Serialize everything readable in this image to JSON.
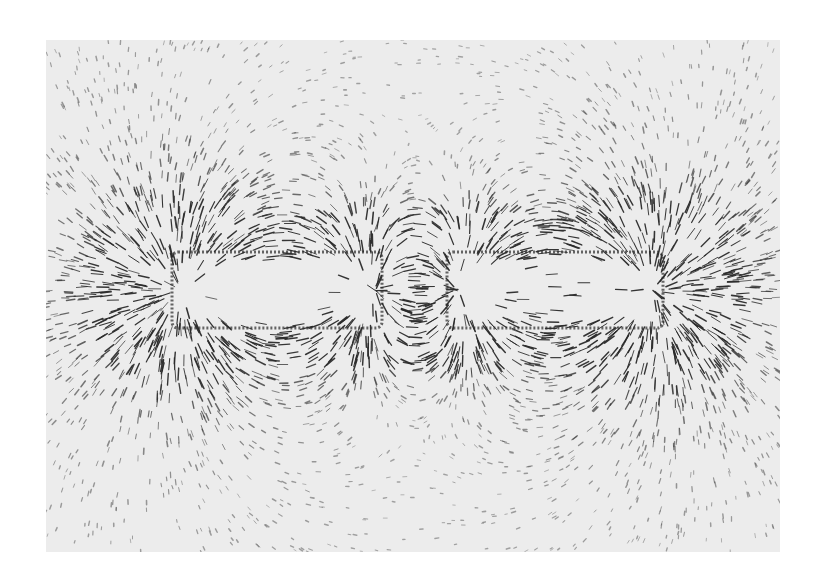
{
  "image": {
    "description": "Photograph of iron filings tracing the magnetic field lines of a bar magnet / two aligned magnet poles on white paper",
    "background_color": "#ffffff",
    "paper_color": "#ececec",
    "filing_color": "#2a2a2a",
    "photo_bounds": {
      "x": 46,
      "y": 40,
      "width": 734,
      "height": 512
    },
    "poles": [
      {
        "name": "left-pole",
        "x": 172,
        "y": 252,
        "width": 210,
        "height": 76
      },
      {
        "name": "right-pole",
        "x": 447,
        "y": 252,
        "width": 216,
        "height": 76
      }
    ],
    "field": {
      "dipole_left_x": 395,
      "dipole_right_x": 437,
      "center_y": 290,
      "filing_count": 5200,
      "seed": 7
    }
  }
}
